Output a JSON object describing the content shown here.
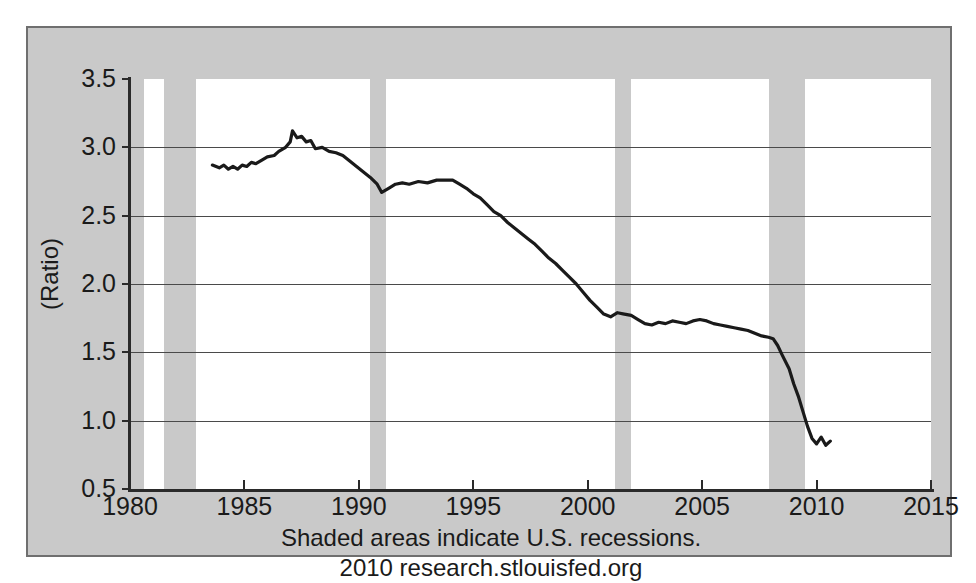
{
  "chart_data": {
    "type": "line",
    "title": "",
    "subtitle": "",
    "xlabel": "",
    "ylabel": "(Ratio)",
    "xlim": [
      1980,
      2015
    ],
    "ylim": [
      0.5,
      3.5
    ],
    "grid": true,
    "legend": false,
    "x_ticks": [
      "1980",
      "1985",
      "1990",
      "1995",
      "2000",
      "2005",
      "2010",
      "2015"
    ],
    "x_tick_values": [
      1980,
      1985,
      1990,
      1995,
      2000,
      2005,
      2010,
      2015
    ],
    "y_ticks": [
      "3.5",
      "3.0",
      "2.5",
      "2.0",
      "1.5",
      "1.0",
      "0.5"
    ],
    "y_tick_values": [
      3.5,
      3.0,
      2.5,
      2.0,
      1.5,
      1.0,
      0.5
    ],
    "line_color": "#1a1a1a",
    "plot_background": "#ffffff",
    "figure_background": "#c9c9c9",
    "shaded_region_color": "#c9c9c9",
    "annotations": [
      "Shaded areas indicate U.S. recessions.",
      "2010 research.stlouisfed.org"
    ],
    "recessions": [
      {
        "start": 1980.0,
        "end": 1980.6
      },
      {
        "start": 1981.5,
        "end": 1982.9
      },
      {
        "start": 1990.5,
        "end": 1991.2
      },
      {
        "start": 2001.2,
        "end": 2001.9
      },
      {
        "start": 2007.9,
        "end": 2009.5
      }
    ],
    "series": [
      {
        "name": "Ratio",
        "x": [
          1983.6,
          1983.9,
          1984.1,
          1984.3,
          1984.5,
          1984.7,
          1984.9,
          1985.1,
          1985.3,
          1985.5,
          1985.8,
          1986.0,
          1986.3,
          1986.5,
          1986.8,
          1987.0,
          1987.1,
          1987.3,
          1987.5,
          1987.7,
          1987.9,
          1988.1,
          1988.4,
          1988.7,
          1989.0,
          1989.3,
          1989.6,
          1989.9,
          1990.2,
          1990.5,
          1990.8,
          1991.0,
          1991.3,
          1991.6,
          1991.9,
          1992.2,
          1992.6,
          1993.0,
          1993.4,
          1993.8,
          1994.1,
          1994.4,
          1994.7,
          1995.0,
          1995.3,
          1995.6,
          1995.9,
          1996.2,
          1996.5,
          1996.8,
          1997.1,
          1997.4,
          1997.7,
          1998.0,
          1998.3,
          1998.6,
          1998.9,
          1999.2,
          1999.5,
          1999.8,
          2000.1,
          2000.4,
          2000.7,
          2001.0,
          2001.3,
          2001.6,
          2001.9,
          2002.2,
          2002.5,
          2002.8,
          2003.1,
          2003.4,
          2003.7,
          2004.0,
          2004.3,
          2004.6,
          2004.9,
          2005.2,
          2005.5,
          2005.8,
          2006.1,
          2006.4,
          2006.7,
          2007.0,
          2007.3,
          2007.6,
          2007.9,
          2008.1,
          2008.3,
          2008.5,
          2008.8,
          2009.0,
          2009.2,
          2009.4,
          2009.6,
          2009.8,
          2010.0,
          2010.2,
          2010.4,
          2010.6
        ],
        "y": [
          2.87,
          2.85,
          2.87,
          2.84,
          2.86,
          2.84,
          2.87,
          2.86,
          2.89,
          2.88,
          2.91,
          2.93,
          2.94,
          2.97,
          3.0,
          3.04,
          3.12,
          3.07,
          3.08,
          3.04,
          3.05,
          2.99,
          3.0,
          2.97,
          2.96,
          2.94,
          2.9,
          2.86,
          2.82,
          2.78,
          2.73,
          2.67,
          2.7,
          2.73,
          2.74,
          2.73,
          2.75,
          2.74,
          2.76,
          2.76,
          2.76,
          2.73,
          2.7,
          2.66,
          2.63,
          2.58,
          2.53,
          2.5,
          2.45,
          2.41,
          2.37,
          2.33,
          2.29,
          2.24,
          2.19,
          2.15,
          2.1,
          2.05,
          2.0,
          1.94,
          1.88,
          1.83,
          1.78,
          1.76,
          1.79,
          1.78,
          1.77,
          1.74,
          1.71,
          1.7,
          1.72,
          1.71,
          1.73,
          1.72,
          1.71,
          1.73,
          1.74,
          1.73,
          1.71,
          1.7,
          1.69,
          1.68,
          1.67,
          1.66,
          1.64,
          1.62,
          1.61,
          1.6,
          1.55,
          1.48,
          1.38,
          1.27,
          1.18,
          1.07,
          0.96,
          0.87,
          0.83,
          0.88,
          0.82,
          0.85
        ]
      }
    ]
  },
  "axis": {
    "ylabel": "(Ratio)"
  },
  "caption": {
    "line1": "Shaded areas indicate U.S. recessions.",
    "line2": "2010 research.stlouisfed.org"
  }
}
